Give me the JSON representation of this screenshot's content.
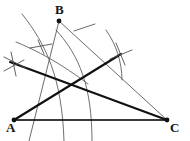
{
  "figure": {
    "kind": "geometric-construction",
    "width": 190,
    "height": 141,
    "background_color": "#ffffff",
    "stroke_color_thin": "#5a5a5a",
    "stroke_color_bold": "#111111",
    "label_color": "#151515"
  },
  "labels": {
    "a": "A",
    "b": "B",
    "c": "C"
  },
  "vertices": {
    "a": {
      "name": "A",
      "x": 14,
      "y": 120
    },
    "b": {
      "name": "B",
      "x": 59,
      "y": 21
    },
    "c": {
      "name": "C",
      "x": 167,
      "y": 120
    }
  },
  "segments": {
    "side_ac": {
      "name": "side-ac",
      "x1": 14,
      "y1": 120,
      "x2": 167,
      "y2": 120,
      "weight": "thin"
    },
    "side_ab_extended": {
      "name": "side-ab-extended",
      "x1": 59,
      "y1": 21,
      "x2": 29,
      "y2": 141,
      "weight": "thin"
    },
    "side_bc": {
      "name": "side-bc",
      "x1": 59,
      "y1": 21,
      "x2": 167,
      "y2": 120,
      "weight": "thin"
    },
    "ray_b_right": {
      "name": "ray-b-upper-right",
      "x1": 83,
      "y1": 29,
      "x2": 94,
      "y2": 25,
      "weight": "thin"
    },
    "cevian_a_to_mark": {
      "name": "bold-cevian-a-to-arc-crossing",
      "x1": 14,
      "y1": 120,
      "x2": 121,
      "y2": 54,
      "weight": "bold"
    },
    "bold_left_to_c": {
      "name": "bold-line-left-crossing-to-c",
      "x1": 10,
      "y1": 62,
      "x2": 167,
      "y2": 120,
      "weight": "bold"
    },
    "bold_ac": {
      "name": "bold-segment-ac",
      "x1": 14,
      "y1": 120,
      "x2": 167,
      "y2": 120,
      "weight": "bold"
    }
  },
  "arcs": {
    "arc_inner_from_a": {
      "name": "arc-inner-centered-a",
      "center_x": 14,
      "center_y": 120,
      "radius": 74,
      "start_deg": 180,
      "end_deg": 262
    },
    "arc_outer_from_a": {
      "name": "arc-outer-centered-a",
      "center_x": 14,
      "center_y": 120,
      "radius": 100,
      "start_deg": 183,
      "end_deg": 265
    },
    "arc_from_b_left": {
      "name": "arc-centered-b-left",
      "center_x": 59,
      "center_y": 21,
      "radius": 45,
      "start_deg": 118,
      "end_deg": 196
    },
    "arc_from_b_right": {
      "name": "arc-centered-b-right",
      "center_x": 59,
      "center_y": 21,
      "radius": 72,
      "start_deg": 6,
      "end_deg": 56
    }
  },
  "arc_crossings": [
    {
      "name": "arc-crossing-right",
      "x": 121,
      "y": 54
    },
    {
      "name": "arc-crossing-left",
      "x": 14,
      "y": 64
    }
  ]
}
